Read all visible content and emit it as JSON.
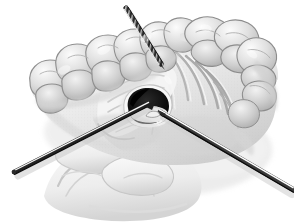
{
  "image": {
    "kind": "medical-illustration",
    "subject": "maxillary-arch-palatal-surgery",
    "title": "Palatal surgical approach with instruments",
    "width": 294,
    "height": 224,
    "background_color": "#ffffff",
    "style": "grayscale stipple line drawing"
  },
  "palette": {
    "background": "#ffffff",
    "tissue_light": "#f2f2f2",
    "tissue_mid": "#d8d8d8",
    "tissue_shadow": "#b8b8b8",
    "tissue_deep_shadow": "#9a9a9a",
    "tooth_light": "#ececec",
    "tooth_mid": "#cfcfcf",
    "tooth_outline": "#8a8a8a",
    "rugae_line": "#a8a8a8",
    "cavity_dark": "#1a1a1a",
    "cavity_black": "#000000",
    "instrument_dark": "#2b2b2b",
    "instrument_mid": "#6e6e6e",
    "instrument_highlight": "#fbfbfb",
    "drop_shadow": "#dcdcdc"
  },
  "anatomy": {
    "regions": [
      {
        "name": "left-maxillary-tooth-row",
        "label": "Left posterior teeth (molars and premolars)",
        "tooth_count": 6
      },
      {
        "name": "right-maxillary-tooth-row",
        "label": "Right posterior teeth (molars and premolars)",
        "tooth_count": 5
      },
      {
        "name": "hard-palate",
        "label": "Hard palate with palatal rugae",
        "rugae_count": 9
      },
      {
        "name": "palatal-flap",
        "label": "Reflected palatal mucoperiosteal flap"
      },
      {
        "name": "surgical-window",
        "label": "Dark surgical opening in palate"
      },
      {
        "name": "tongue-and-lower-lip",
        "label": "Tongue and lower lip (soft tissue, lower field)"
      }
    ]
  },
  "instruments": [
    {
      "name": "probe-needle-superior",
      "label": "Needle / probe entering from upper field",
      "start": {
        "x": 126,
        "y": 8
      },
      "end": {
        "x": 161,
        "y": 64
      },
      "width": 4.2,
      "texture": "knurled",
      "color": "#2b2b2b"
    },
    {
      "name": "elevator-lower-left",
      "label": "Periosteal elevator from lower left",
      "start": {
        "x": 14,
        "y": 172
      },
      "end": {
        "x": 148,
        "y": 104
      },
      "width": 4.0,
      "texture": "smooth",
      "color": "#242424"
    },
    {
      "name": "suction-lower-right",
      "label": "Suction tip / retractor from lower right",
      "start": {
        "x": 292,
        "y": 190
      },
      "end": {
        "x": 160,
        "y": 112
      },
      "width": 4.4,
      "texture": "smooth",
      "color": "#3a3a3a"
    }
  ],
  "accessibility": {
    "alt_text": "Grayscale medical illustration of the upper dental arch viewed from below, showing teeth, palatal rugae, and a dark surgical opening in the palate with three instruments converging on the site."
  }
}
